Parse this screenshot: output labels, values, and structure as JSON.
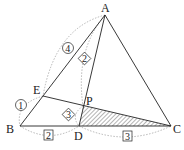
{
  "diagram": {
    "points": {
      "A": {
        "label": "A",
        "x": 105,
        "y": 15
      },
      "B": {
        "label": "B",
        "x": 20,
        "y": 126
      },
      "C": {
        "label": "C",
        "x": 171,
        "y": 126
      },
      "D": {
        "label": "D",
        "x": 79,
        "y": 126
      },
      "E": {
        "label": "E",
        "x": 43,
        "y": 96
      },
      "P": {
        "label": "P",
        "x": 83,
        "y": 106
      }
    },
    "ratios": {
      "AE": {
        "value": "4",
        "style": "circle"
      },
      "EB": {
        "value": "1",
        "style": "circle"
      },
      "AP": {
        "value": "2",
        "style": "diamond"
      },
      "PD": {
        "value": "3",
        "style": "diamond"
      },
      "BD": {
        "value": "2",
        "style": "square"
      },
      "DC": {
        "value": "3",
        "style": "square"
      }
    },
    "shaded_region": "triangle PDC",
    "colors": {
      "line": "#222222",
      "dashed": "#888888",
      "hatch": "#444444"
    }
  }
}
